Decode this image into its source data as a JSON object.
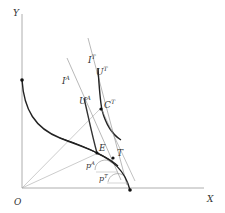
{
  "diagram": {
    "axes": {
      "x_label": "X",
      "y_label": "Y",
      "origin_label": "O"
    },
    "curves": {
      "ppf": "production possibility frontier",
      "u_autarky": "U^A",
      "u_trade": "U^T"
    },
    "lines": {
      "income_autarky": "I^A",
      "income_trade": "I^T"
    },
    "points": {
      "equilibrium": "E",
      "trade_production": "T",
      "trade_consumption": "C^T"
    },
    "prices": {
      "autarky": "p^A",
      "trade": "p^T"
    },
    "labels": {
      "Y": "Y",
      "X": "X",
      "O": "O",
      "IA_base": "I",
      "IA_sup": "A",
      "IT_base": "I",
      "IT_sup": "T",
      "UA_base": "U",
      "UA_sup": "A",
      "UT_base": "U",
      "UT_sup": "T",
      "CT_base": "C",
      "CT_sup": "T",
      "E": "E",
      "T": "T",
      "pA_base": "p",
      "pA_sup": "A",
      "pT_base": "p",
      "pT_sup": "T"
    },
    "colors": {
      "axis": "#999999",
      "curve": "#222222",
      "thin": "#888888"
    }
  }
}
